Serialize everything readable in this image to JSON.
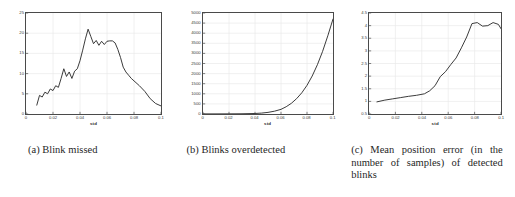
{
  "figure": {
    "caption_a": "(a) Blink missed",
    "caption_b": "(b) Blinks overdetected",
    "caption_c": "(c) Mean position error (in the number of samples) of detected blinks"
  },
  "chart_data": [
    {
      "type": "line",
      "title": "",
      "panel": "a",
      "xlabel": "std",
      "ylabel": "",
      "xlim": [
        0,
        0.1
      ],
      "ylim": [
        0,
        25
      ],
      "grid": true,
      "legend": false,
      "xticks": [
        "0",
        "0.02",
        "0.04",
        "0.06",
        "0.08",
        "0.1"
      ],
      "xtick_values": [
        0,
        0.02,
        0.04,
        0.06,
        0.08,
        0.1
      ],
      "yticks": [
        "0",
        "5",
        "10",
        "15",
        "20",
        "25"
      ],
      "ytick_values": [
        0,
        5,
        10,
        15,
        20,
        25
      ],
      "series": [
        {
          "name": "blinks missed",
          "color": "#262626",
          "x": [
            0.008,
            0.01,
            0.012,
            0.014,
            0.016,
            0.018,
            0.02,
            0.022,
            0.024,
            0.026,
            0.028,
            0.03,
            0.032,
            0.034,
            0.036,
            0.038,
            0.04,
            0.042,
            0.044,
            0.046,
            0.048,
            0.05,
            0.052,
            0.054,
            0.056,
            0.058,
            0.06,
            0.062,
            0.064,
            0.066,
            0.068,
            0.07,
            0.072,
            0.074,
            0.076,
            0.078,
            0.08,
            0.084,
            0.088,
            0.092,
            0.096,
            0.1
          ],
          "y": [
            2.2,
            4.6,
            4.2,
            5.4,
            5.0,
            6.2,
            5.8,
            7.0,
            6.6,
            8.8,
            11.2,
            9.3,
            10.4,
            8.8,
            10.6,
            11.2,
            13.2,
            15.8,
            18.6,
            21.0,
            19.2,
            17.4,
            18.2,
            17.0,
            18.0,
            17.2,
            18.0,
            18.1,
            18.1,
            17.6,
            16.0,
            14.0,
            11.6,
            10.4,
            9.6,
            8.8,
            8.2,
            7.0,
            5.6,
            3.8,
            2.6,
            2.0
          ]
        }
      ]
    },
    {
      "type": "line",
      "title": "",
      "panel": "b",
      "xlabel": "std",
      "ylabel": "",
      "xlim": [
        0,
        0.1
      ],
      "ylim": [
        0,
        5000
      ],
      "grid": true,
      "legend": false,
      "xticks": [
        "0",
        "0.02",
        "0.04",
        "0.06",
        "0.08",
        "0.1"
      ],
      "xtick_values": [
        0,
        0.02,
        0.04,
        0.06,
        0.08,
        0.1
      ],
      "yticks": [
        "0",
        "500",
        "1000",
        "1500",
        "2000",
        "2500",
        "3000",
        "3500",
        "4000",
        "4500",
        "5000"
      ],
      "ytick_values": [
        0,
        500,
        1000,
        1500,
        2000,
        2500,
        3000,
        3500,
        4000,
        4500,
        5000
      ],
      "series": [
        {
          "name": "blinks overdetected",
          "color": "#262626",
          "x": [
            0.0,
            0.01,
            0.02,
            0.03,
            0.04,
            0.045,
            0.05,
            0.055,
            0.06,
            0.064,
            0.068,
            0.072,
            0.076,
            0.08,
            0.084,
            0.088,
            0.092,
            0.096,
            0.1
          ],
          "y": [
            5,
            6,
            8,
            12,
            25,
            45,
            80,
            140,
            230,
            360,
            530,
            760,
            1050,
            1420,
            1880,
            2440,
            3100,
            3870,
            4700
          ]
        }
      ]
    },
    {
      "type": "line",
      "title": "",
      "panel": "c",
      "xlabel": "std",
      "ylabel": "",
      "xlim": [
        0,
        0.1
      ],
      "ylim": [
        0.5,
        4.5
      ],
      "grid": true,
      "legend": false,
      "xticks": [
        "0",
        "0.02",
        "0.04",
        "0.06",
        "0.08",
        "0.1"
      ],
      "xtick_values": [
        0,
        0.02,
        0.04,
        0.06,
        0.08,
        0.1
      ],
      "yticks": [
        "0.5",
        "1",
        "1.5",
        "2",
        "2.5",
        "3",
        "3.5",
        "4",
        "4.5"
      ],
      "ytick_values": [
        0.5,
        1,
        1.5,
        2,
        2.5,
        3,
        3.5,
        4,
        4.5
      ],
      "series": [
        {
          "name": "mean position error",
          "color": "#262626",
          "x": [
            0.006,
            0.012,
            0.018,
            0.024,
            0.03,
            0.036,
            0.042,
            0.046,
            0.05,
            0.054,
            0.058,
            0.062,
            0.066,
            0.07,
            0.074,
            0.078,
            0.082,
            0.086,
            0.09,
            0.094,
            0.098,
            0.1
          ],
          "y": [
            0.98,
            1.05,
            1.1,
            1.15,
            1.2,
            1.24,
            1.3,
            1.42,
            1.62,
            1.98,
            2.18,
            2.46,
            2.72,
            3.12,
            3.55,
            4.08,
            4.12,
            3.98,
            4.0,
            4.12,
            4.05,
            3.88
          ]
        }
      ]
    }
  ]
}
